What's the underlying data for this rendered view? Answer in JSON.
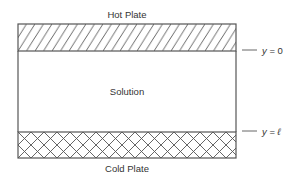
{
  "diagram": {
    "top_label": "Hot Plate",
    "middle_label": "Solution",
    "bottom_label": "Cold Plate",
    "markers": [
      {
        "var": "y",
        "eq": " = ",
        "value": "0"
      },
      {
        "var": "y",
        "eq": " = ",
        "value": "ℓ"
      }
    ],
    "colors": {
      "stroke": "#555555",
      "text": "#333333",
      "background": "#ffffff"
    },
    "hatch": {
      "hot_plate": "diagonal",
      "cold_plate": "crosshatch"
    }
  }
}
